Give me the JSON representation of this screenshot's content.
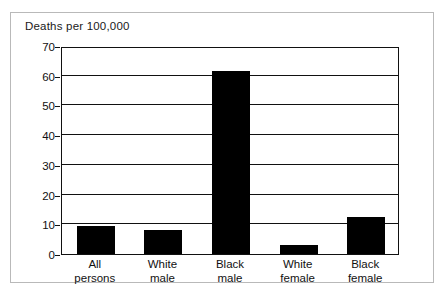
{
  "chart": {
    "title": "Deaths per 100,000"
  },
  "chart_data": {
    "type": "bar",
    "title": "Deaths per 100,000",
    "xlabel": "",
    "ylabel": "Deaths per 100,000",
    "ylim": [
      0,
      70
    ],
    "grid": true,
    "legend": "none",
    "orientation": "vertical",
    "bar_color": "#000000",
    "categories": [
      "All\npersons",
      "White\nmale",
      "Black\nmale",
      "White\nfemale",
      "Black\nfemale"
    ],
    "category_lines": [
      [
        "All",
        "persons"
      ],
      [
        "White",
        "male"
      ],
      [
        "Black",
        "male"
      ],
      [
        "White",
        "female"
      ],
      [
        "Black",
        "female"
      ]
    ],
    "values": [
      9.3,
      8.0,
      61.5,
      3.0,
      12.5
    ],
    "yticks": [
      0,
      10,
      20,
      30,
      40,
      50,
      60,
      70
    ],
    "ytick_labels": [
      "0",
      "10",
      "20",
      "30",
      "40",
      "50",
      "60",
      "70"
    ]
  }
}
